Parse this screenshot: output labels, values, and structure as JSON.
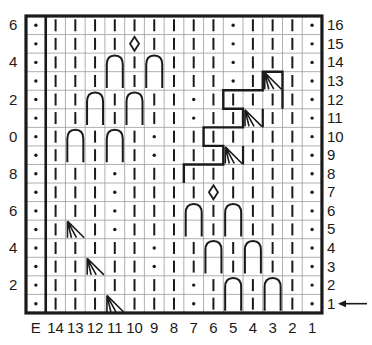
{
  "chart": {
    "columns": [
      "E",
      "14",
      "13",
      "12",
      "11",
      "10",
      "9",
      "8",
      "7",
      "6",
      "5",
      "4",
      "3",
      "2",
      "1"
    ],
    "row_labels_right": [
      "16",
      "15",
      "14",
      "13",
      "12",
      "11",
      "10",
      "9",
      "8",
      "7",
      "6",
      "5",
      "4",
      "3",
      "2",
      "1"
    ],
    "row_labels_left": [
      {
        "row": 16,
        "text": "6"
      },
      {
        "row": 14,
        "text": "4"
      },
      {
        "row": 12,
        "text": "2"
      },
      {
        "row": 10,
        "text": "0"
      },
      {
        "row": 8,
        "text": "8"
      },
      {
        "row": 6,
        "text": "6"
      },
      {
        "row": 4,
        "text": "4"
      },
      {
        "row": 2,
        "text": "2"
      }
    ],
    "start_row_indicator": {
      "row": 1,
      "icon": "arrow-left-icon"
    },
    "legend_symbols": {
      "|": "knit",
      "•": "purl",
      "◊": "diamond-bobble",
      "O": "cable-oval-2-rows",
      "D": "decrease-fan"
    },
    "rows": [
      {
        "row": 16,
        "cells": [
          "•",
          "|",
          "|",
          "|",
          "|",
          "|",
          "|",
          "|",
          "|",
          "|",
          "•",
          "|",
          "|",
          "|",
          "•"
        ]
      },
      {
        "row": 15,
        "cells": [
          "•",
          "|",
          "|",
          "|",
          "|",
          "◊",
          "|",
          "|",
          "|",
          "|",
          "•",
          "|",
          "|",
          "|",
          "•"
        ]
      },
      {
        "row": 14,
        "cells": [
          "•",
          "|",
          "|",
          "|",
          "O",
          "|",
          "O",
          "|",
          "|",
          "|",
          "•",
          "|",
          "|",
          "|",
          "•"
        ]
      },
      {
        "row": 13,
        "cells": [
          "•",
          "|",
          "|",
          "|",
          "o",
          "|",
          "o",
          "|",
          "|",
          "|",
          "•",
          "|",
          "D",
          "|",
          "•"
        ]
      },
      {
        "row": 12,
        "cells": [
          "•",
          "|",
          "|",
          "O",
          "|",
          "O",
          "|",
          "|",
          "•",
          "|",
          "|",
          "|",
          "|",
          "|",
          "•"
        ]
      },
      {
        "row": 11,
        "cells": [
          "•",
          "|",
          "|",
          "o",
          "|",
          "o",
          "|",
          "|",
          "•",
          "|",
          "|",
          "D",
          "|",
          "|",
          "•"
        ]
      },
      {
        "row": 10,
        "cells": [
          "•",
          "|",
          "O",
          "|",
          "O",
          "|",
          "•",
          "|",
          "|",
          "|",
          "|",
          "|",
          "|",
          "|",
          "•"
        ]
      },
      {
        "row": 9,
        "cells": [
          "•",
          "|",
          "o",
          "|",
          "o",
          "|",
          "•",
          "|",
          "|",
          "|",
          "D",
          "|",
          "|",
          "|",
          "•"
        ]
      },
      {
        "row": 8,
        "cells": [
          "•",
          "|",
          "|",
          "|",
          "•",
          "|",
          "|",
          "|",
          "|",
          "|",
          "|",
          "|",
          "|",
          "|",
          "•"
        ]
      },
      {
        "row": 7,
        "cells": [
          "•",
          "|",
          "|",
          "|",
          "•",
          "|",
          "|",
          "|",
          "|",
          "◊",
          "|",
          "|",
          "|",
          "|",
          "•"
        ]
      },
      {
        "row": 6,
        "cells": [
          "•",
          "|",
          "|",
          "|",
          "•",
          "|",
          "|",
          "|",
          "O",
          "|",
          "O",
          "|",
          "|",
          "|",
          "•"
        ]
      },
      {
        "row": 5,
        "cells": [
          "•",
          "|",
          "D",
          "|",
          "•",
          "|",
          "|",
          "|",
          "o",
          "|",
          "o",
          "|",
          "|",
          "|",
          "•"
        ]
      },
      {
        "row": 4,
        "cells": [
          "•",
          "|",
          "|",
          "|",
          "|",
          "|",
          "•",
          "|",
          "|",
          "O",
          "|",
          "O",
          "|",
          "|",
          "•"
        ]
      },
      {
        "row": 3,
        "cells": [
          "•",
          "|",
          "|",
          "D",
          "|",
          "|",
          "•",
          "|",
          "|",
          "o",
          "|",
          "o",
          "|",
          "|",
          "•"
        ]
      },
      {
        "row": 2,
        "cells": [
          "•",
          "|",
          "|",
          "|",
          "|",
          "|",
          "|",
          "|",
          "•",
          "|",
          "O",
          "|",
          "O",
          "|",
          "•"
        ]
      },
      {
        "row": 1,
        "cells": [
          "•",
          "|",
          "|",
          "|",
          "D",
          "|",
          "|",
          "|",
          "•",
          "|",
          "o",
          "|",
          "o",
          "|",
          "•"
        ]
      }
    ],
    "outline_stairs": [
      {
        "row": 13,
        "from_col": "3",
        "to_col": "3"
      },
      {
        "row": 12,
        "from_col": "5",
        "to_col": "3"
      },
      {
        "row": 11,
        "from_col": "5",
        "to_col": "4"
      },
      {
        "row": 10,
        "from_col": "6",
        "to_col": "4"
      },
      {
        "row": 9,
        "from_col": "6",
        "to_col": "5"
      },
      {
        "row": 8,
        "from_col": "7",
        "to_col": "5"
      }
    ],
    "colors": {
      "ink": "#1a1a1a",
      "grid": "#9a9a9a",
      "background": "#ffffff"
    }
  }
}
